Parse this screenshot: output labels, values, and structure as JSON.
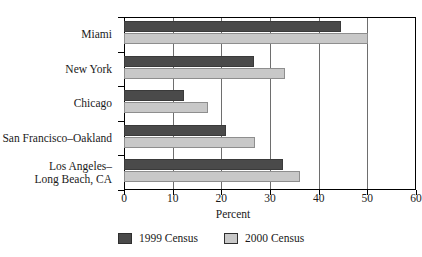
{
  "chart_data": {
    "type": "bar",
    "orientation": "horizontal",
    "title": "",
    "xlabel": "Percent",
    "ylabel": "",
    "xlim": [
      0,
      60
    ],
    "xticks": [
      0,
      10,
      20,
      30,
      40,
      50,
      60
    ],
    "xtick_labels": [
      "0",
      "10",
      "20",
      "30",
      "40",
      "50",
      "60"
    ],
    "grid": "vertical",
    "legend_position": "bottom-center",
    "categories": [
      "Miami",
      "New York",
      "Chicago",
      "San Francisco–Oakland",
      "Los Angeles–\nLong Beach, CA"
    ],
    "series": [
      {
        "name": "1999 Census",
        "color": "#4a4a4a",
        "values": [
          44.5,
          26.7,
          12.3,
          21.0,
          32.6
        ]
      },
      {
        "name": "2000 Census",
        "color": "#c8c8c8",
        "values": [
          50.1,
          33.1,
          17.2,
          26.9,
          36.1
        ]
      }
    ]
  },
  "axis": {
    "x_title": "Percent"
  },
  "legend": {
    "items": [
      {
        "label": "1999 Census",
        "color": "#4a4a4a"
      },
      {
        "label": "2000 Census",
        "color": "#c8c8c8"
      }
    ]
  }
}
